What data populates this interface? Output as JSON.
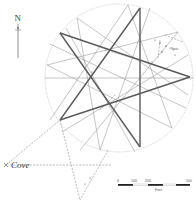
{
  "diagram": {
    "north_label": "N",
    "place_label": "Cove",
    "feature_label": "Spur",
    "circle": {
      "cx": 119,
      "cy": 78,
      "r": 74
    },
    "bold_star_vertices": [
      [
        140,
        8
      ],
      [
        60,
        33
      ],
      [
        190,
        77
      ],
      [
        60,
        120
      ],
      [
        140,
        147
      ]
    ],
    "scale_bar": {
      "ticks": [
        "0",
        "100",
        "200",
        "500"
      ],
      "unit": "Feet"
    },
    "colors": {
      "bold_line": "#555555",
      "thin_line": "#8a8a8a",
      "circle": "#b5b5b5",
      "dashed": "#777777"
    }
  }
}
